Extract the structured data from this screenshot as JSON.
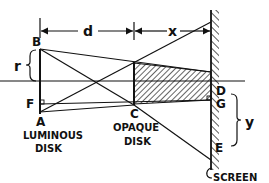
{
  "diagram": {
    "type": "optics-shadow-geometry",
    "colors": {
      "ink": "#111111",
      "background": "#ffffff"
    },
    "points": {
      "B": "B",
      "A": "A",
      "F": "F",
      "C": "C",
      "D": "D",
      "G": "G",
      "E": "E"
    },
    "dimensions": {
      "d": "d",
      "x": "x",
      "r": "r",
      "y": "y"
    },
    "labels": {
      "luminous_disk_line1": "LUMINOUS",
      "luminous_disk_line2": "DISK",
      "opaque_disk_line1": "OPAQUE",
      "opaque_disk_line2": "DISK",
      "screen": "SCREEN"
    }
  }
}
